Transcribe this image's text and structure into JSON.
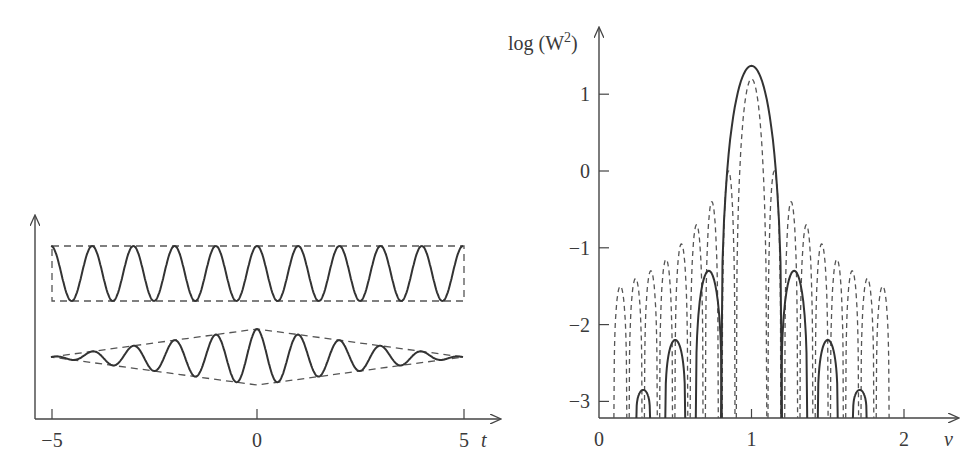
{
  "chart_data": [
    {
      "type": "line",
      "panel": "left",
      "title": "",
      "xlabel": "t",
      "ylabel": "",
      "xlim": [
        -5.3,
        5.6
      ],
      "x_ticks": [
        -5,
        0,
        5
      ],
      "x_tick_labels": [
        "−5",
        "0",
        "5"
      ],
      "grid": false,
      "series": [
        {
          "name": "constant-amplitude wave",
          "style": "solid",
          "function": "cos(2*pi*t)",
          "t_range": [
            -5,
            5
          ],
          "amplitude": 1,
          "cycles": 10
        },
        {
          "name": "constant-amplitude envelope",
          "style": "dashed",
          "shape": "rectangle",
          "t_range": [
            -5,
            5
          ]
        },
        {
          "name": "triangular-amplitude wave",
          "style": "solid",
          "function": "(1-|t|/5)*cos(2*pi*t)",
          "t_range": [
            -5,
            5
          ],
          "cycles": 10
        },
        {
          "name": "triangular envelope",
          "style": "dashed",
          "shape": "diamond",
          "t_range": [
            -5,
            5
          ]
        }
      ]
    },
    {
      "type": "line",
      "panel": "right",
      "title": "",
      "xlabel": "ν",
      "ylabel": "log (W²)",
      "xlim": [
        0,
        2.2
      ],
      "ylim": [
        -3.2,
        1.6
      ],
      "x_ticks": [
        0,
        1,
        2
      ],
      "x_tick_labels": [
        "0",
        "1",
        "2"
      ],
      "y_ticks": [
        1,
        0,
        -1,
        -2,
        -3
      ],
      "y_tick_labels": [
        "1",
        "0",
        "−1",
        "−2",
        "−3"
      ],
      "grid": false,
      "series": [
        {
          "name": "triangular window spectrum",
          "style": "solid",
          "main_lobe": {
            "center": 1.0,
            "peak": 1.37,
            "half_width": 0.2
          },
          "side_lobes": [
            {
              "center": 0.29,
              "peak": -2.85
            },
            {
              "center": 0.5,
              "peak": -2.2
            },
            {
              "center": 0.72,
              "peak": -1.3
            },
            {
              "center": 1.28,
              "peak": -1.3
            },
            {
              "center": 1.5,
              "peak": -2.2
            },
            {
              "center": 1.71,
              "peak": -2.85
            }
          ]
        },
        {
          "name": "rectangular window spectrum",
          "style": "dashed",
          "main_lobe": {
            "center": 1.0,
            "peak": 1.2,
            "half_width": 0.1
          },
          "side_lobes": [
            {
              "center": 0.14,
              "peak": -1.5
            },
            {
              "center": 0.24,
              "peak": -1.4
            },
            {
              "center": 0.34,
              "peak": -1.3
            },
            {
              "center": 0.44,
              "peak": -1.15
            },
            {
              "center": 0.54,
              "peak": -0.95
            },
            {
              "center": 0.64,
              "peak": -0.7
            },
            {
              "center": 0.74,
              "peak": -0.4
            },
            {
              "center": 0.85,
              "peak": 0.0
            },
            {
              "center": 1.15,
              "peak": 0.0
            },
            {
              "center": 1.26,
              "peak": -0.4
            },
            {
              "center": 1.36,
              "peak": -0.7
            },
            {
              "center": 1.46,
              "peak": -0.95
            },
            {
              "center": 1.56,
              "peak": -1.15
            },
            {
              "center": 1.66,
              "peak": -1.3
            },
            {
              "center": 1.76,
              "peak": -1.4
            },
            {
              "center": 1.86,
              "peak": -1.5
            }
          ]
        }
      ]
    }
  ],
  "labels": {
    "left_xlabel": "t",
    "left_ticks": [
      "−5",
      "0",
      "5"
    ],
    "right_xlabel": "ν",
    "right_ylabel_main": "log (W",
    "right_ylabel_sup": "2",
    "right_ylabel_close": ")",
    "right_xticks": [
      "0",
      "1",
      "2"
    ],
    "right_yticks": [
      "1",
      "0",
      "−1",
      "−2",
      "−3"
    ]
  }
}
